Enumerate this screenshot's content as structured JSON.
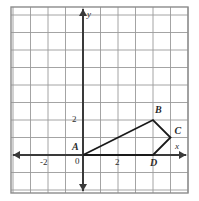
{
  "figure": {
    "type": "coordinate-plane-polygon",
    "background_color": "#ffffff",
    "grid_color": "#9a9a9a",
    "axis_color": "#3a3a3a",
    "border_color": "#8c8c8c",
    "shape_color": "#1a1a1a",
    "text_color": "#2b2b2b"
  },
  "axes": {
    "x_axis_label": "x",
    "y_axis_label": "y",
    "origin_label": "0",
    "x_ticks": [
      {
        "label": "-2",
        "value": -2
      },
      {
        "label": "2",
        "value": 2
      }
    ],
    "y_ticks": [
      {
        "label": "2",
        "value": 2
      }
    ],
    "x_range": [
      -4,
      6
    ],
    "y_range": [
      -2,
      8
    ],
    "grid_step": 1,
    "grid_visible": true
  },
  "polygon": {
    "name": "ABCD",
    "closed": true,
    "vertices": [
      {
        "label": "A",
        "x": 0,
        "y": 0,
        "label_dx": -11,
        "label_dy": -13
      },
      {
        "label": "B",
        "x": 4,
        "y": 2,
        "label_dx": 2,
        "label_dy": -15
      },
      {
        "label": "C",
        "x": 5,
        "y": 1,
        "label_dx": 4,
        "label_dy": -12
      },
      {
        "label": "D",
        "x": 4,
        "y": 0,
        "label_dx": -3,
        "label_dy": 3
      }
    ]
  },
  "geometry": {
    "origin_px_x": 83,
    "origin_px_y": 155,
    "unit_px": 17.5,
    "plot_left": 11,
    "plot_top": 7,
    "plot_right": 188,
    "plot_bottom": 193
  },
  "chart_data": {
    "type": "scatter",
    "title": "",
    "xlabel": "x",
    "ylabel": "y",
    "xlim": [
      -4,
      6
    ],
    "ylim": [
      -2,
      8
    ],
    "grid": true,
    "series": [
      {
        "name": "Quadrilateral ABCD",
        "x": [
          0,
          4,
          5,
          4,
          0
        ],
        "y": [
          0,
          2,
          1,
          0,
          0
        ],
        "point_labels": [
          "A",
          "B",
          "C",
          "D",
          "A"
        ]
      }
    ]
  }
}
